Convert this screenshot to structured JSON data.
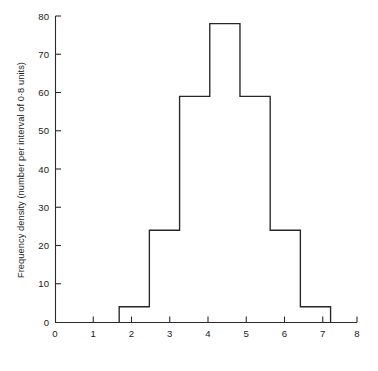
{
  "chart_data": {
    "type": "bar",
    "title": "",
    "subtitle": "",
    "xlabel": "Mean of sample",
    "ylabel": "Frequency density (number per interval of 0·8 units)",
    "xlim": [
      0,
      8
    ],
    "ylim": [
      0,
      80
    ],
    "xticks": [
      0,
      1,
      2,
      3,
      4,
      5,
      6,
      7,
      8
    ],
    "xticklabels": [
      "0",
      "1",
      "2",
      "3",
      "4",
      "5",
      "6",
      "7",
      "8"
    ],
    "yticks": [
      0,
      10,
      20,
      30,
      40,
      50,
      60,
      70,
      80
    ],
    "yticklabels": [
      "0",
      "10",
      "20",
      "30",
      "40",
      "50",
      "60",
      "70",
      "80"
    ],
    "grid": false,
    "legend": null,
    "bin_width": 0.8,
    "bin_edges": [
      1.7,
      2.5,
      3.3,
      4.1,
      4.9,
      5.7,
      6.5,
      7.3
    ],
    "categories": [
      "1.7-2.5",
      "2.5-3.3",
      "3.3-4.1",
      "4.1-4.9",
      "4.9-5.7",
      "5.7-6.5",
      "6.5-7.3"
    ],
    "values": [
      4,
      24,
      59,
      78,
      59,
      24,
      4
    ],
    "bar_fill": "#ffffff",
    "bar_stroke": "#262626",
    "axis_color": "#2b2b2b",
    "background": "#ffffff"
  }
}
